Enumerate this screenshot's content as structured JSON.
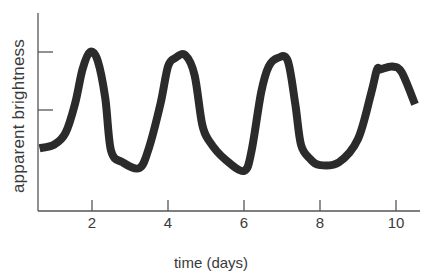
{
  "chart_data": {
    "type": "line",
    "title": "",
    "xlabel": "time (days)",
    "ylabel": "apparent brightness",
    "xlim": [
      0.6,
      10.6
    ],
    "ylim": [
      0,
      2.7
    ],
    "x_ticks": [
      2,
      4,
      6,
      8,
      10
    ],
    "x_tick_labels": [
      "2",
      "4",
      "6",
      "8",
      "10"
    ],
    "y_ticks": [
      1,
      2
    ],
    "y_tick_labels": [
      "",
      ""
    ],
    "grid": false,
    "legend": null,
    "series": [
      {
        "name": "brightness curve",
        "color": "#2b2b2b",
        "x": [
          0.62,
          1.0,
          1.3,
          1.55,
          1.75,
          1.95,
          2.15,
          2.35,
          2.5,
          2.8,
          3.25,
          3.5,
          3.8,
          4.0,
          4.2,
          4.45,
          4.7,
          4.9,
          5.1,
          5.5,
          6.0,
          6.2,
          6.45,
          6.65,
          6.9,
          7.15,
          7.35,
          7.5,
          7.75,
          8.0,
          8.5,
          9.0,
          9.35,
          9.5,
          9.6,
          9.9,
          10.15,
          10.5
        ],
        "y": [
          0.34,
          0.4,
          0.6,
          1.1,
          1.7,
          2.0,
          1.85,
          1.2,
          0.3,
          0.1,
          0.0,
          0.35,
          1.1,
          1.75,
          1.9,
          1.95,
          1.6,
          0.75,
          0.45,
          0.15,
          -0.05,
          0.3,
          1.3,
          1.75,
          1.9,
          1.85,
          1.1,
          0.4,
          0.15,
          0.05,
          0.1,
          0.5,
          1.3,
          1.7,
          1.7,
          1.75,
          1.65,
          1.1
        ]
      }
    ]
  },
  "axes": {
    "ylabel": "apparent brightness",
    "xlabel": "time (days)",
    "x_tick_labels": [
      "2",
      "4",
      "6",
      "8",
      "10"
    ]
  }
}
